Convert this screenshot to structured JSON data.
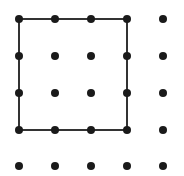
{
  "diagram": {
    "type": "dot-grid",
    "grid": {
      "columns": 5,
      "rows": 5,
      "x_positions": [
        19,
        55,
        91,
        127,
        163
      ],
      "y_positions": [
        19,
        56,
        93,
        130,
        166
      ],
      "dot_radius": 4,
      "dot_color": "#1a1a1a"
    },
    "square": {
      "from_col": 0,
      "from_row": 0,
      "to_col": 3,
      "to_row": 3,
      "side_in_units": 3,
      "stroke_color": "#333333",
      "stroke_width": 2
    }
  }
}
